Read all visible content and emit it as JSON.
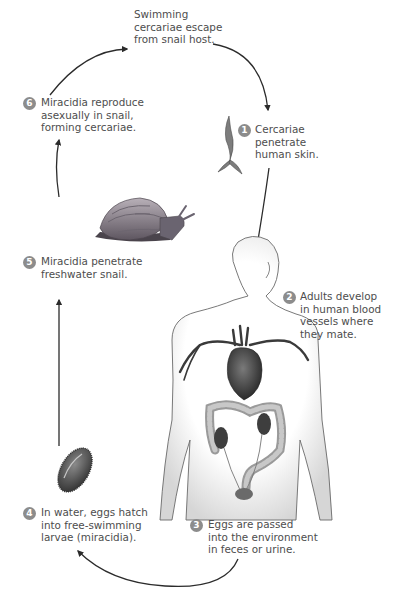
{
  "diagram": {
    "type": "life-cycle",
    "colors": {
      "text": "#4d4d4d",
      "badge": "#8c8c8c",
      "arrow": "#2b2b2b"
    },
    "intro": {
      "lines": [
        "Swimming",
        "cercariae escape",
        "from snail host."
      ]
    },
    "steps": [
      {
        "number": "1",
        "lines": [
          "Cercariae",
          "penetrate",
          "human skin."
        ],
        "illustration": "cercaria"
      },
      {
        "number": "2",
        "lines": [
          "Adults develop",
          "in human blood",
          "vessels where",
          "they mate."
        ],
        "illustration": "human-body"
      },
      {
        "number": "3",
        "lines": [
          "Eggs are passed",
          "into the environment",
          "in feces or urine."
        ],
        "illustration": "none"
      },
      {
        "number": "4",
        "lines": [
          "In water, eggs hatch",
          "into free-swimming",
          "larvae (miracidia)."
        ],
        "illustration": "miracidium"
      },
      {
        "number": "5",
        "lines": [
          "Miracidia penetrate",
          "freshwater snail."
        ],
        "illustration": "snail"
      },
      {
        "number": "6",
        "lines": [
          "Miracidia reproduce",
          "asexually in snail,",
          "forming cercariae."
        ],
        "illustration": "none"
      }
    ],
    "arrows": [
      {
        "from": "6",
        "to": "intro",
        "direction": "up-right"
      },
      {
        "from": "intro",
        "to": "1",
        "direction": "right-down"
      },
      {
        "from": "1",
        "to": "2",
        "direction": "down"
      },
      {
        "from": "3",
        "to": "4",
        "direction": "down-left"
      },
      {
        "from": "4",
        "to": "5",
        "direction": "up"
      },
      {
        "from": "5",
        "to": "6",
        "direction": "up"
      }
    ]
  }
}
